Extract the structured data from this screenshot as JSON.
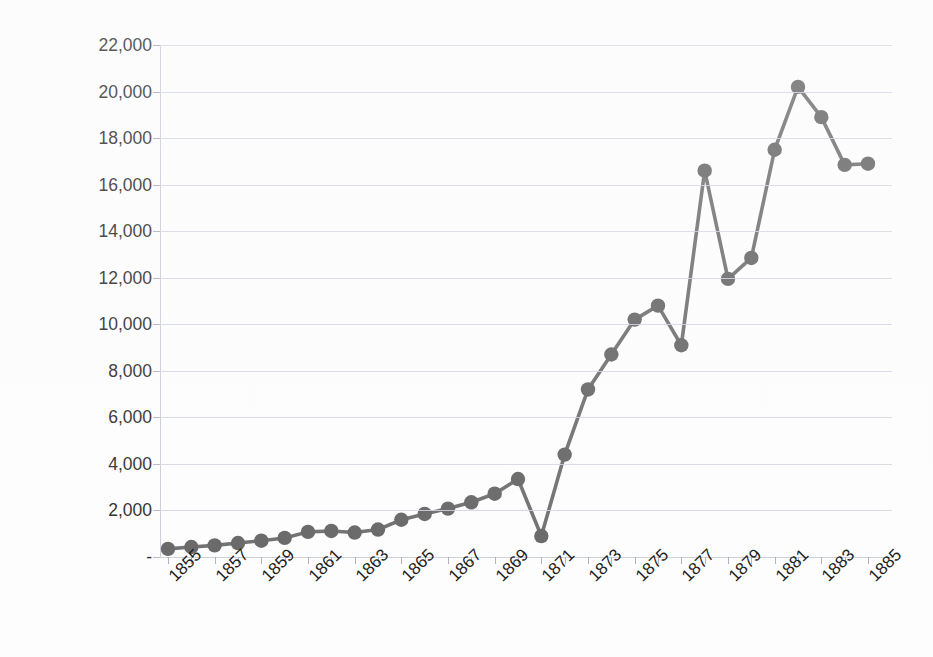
{
  "chart_data": {
    "type": "line",
    "title": "",
    "xlabel": "",
    "ylabel": "Quantity consumed (g)",
    "x": [
      1855,
      1856,
      1857,
      1858,
      1859,
      1860,
      1861,
      1862,
      1863,
      1864,
      1865,
      1866,
      1867,
      1868,
      1869,
      1870,
      1871,
      1872,
      1873,
      1874,
      1875,
      1876,
      1877,
      1878,
      1879,
      1880,
      1881,
      1882,
      1883,
      1884,
      1885
    ],
    "values": [
      350,
      430,
      500,
      600,
      700,
      820,
      1080,
      1120,
      1050,
      1180,
      1600,
      1850,
      2080,
      2350,
      2720,
      3350,
      900,
      4400,
      7200,
      8700,
      10200,
      10800,
      9100,
      16600,
      11950,
      12850,
      17500,
      20200,
      18900,
      16850,
      16900
    ],
    "series": [
      {
        "name": "Quantity consumed",
        "values": [
          350,
          430,
          500,
          600,
          700,
          820,
          1080,
          1120,
          1050,
          1180,
          1600,
          1850,
          2080,
          2350,
          2720,
          3350,
          900,
          4400,
          7200,
          8700,
          10200,
          10800,
          9100,
          16600,
          11950,
          12850,
          17500,
          20200,
          18900,
          16850,
          16900
        ]
      }
    ],
    "ylim": [
      0,
      22000
    ],
    "xlim": [
      1855,
      1885
    ],
    "y_ticks": [
      0,
      2000,
      4000,
      6000,
      8000,
      10000,
      12000,
      14000,
      16000,
      18000,
      20000,
      22000
    ],
    "y_tick_labels": [
      "-",
      "2,000",
      "4,000",
      "6,000",
      "8,000",
      "10,000",
      "12,000",
      "14,000",
      "16,000",
      "18,000",
      "20,000",
      "22,000"
    ],
    "x_tick_labels": [
      "1855",
      "1857",
      "1859",
      "1861",
      "1863",
      "1865",
      "1867",
      "1869",
      "1871",
      "1873",
      "1875",
      "1877",
      "1879",
      "1881",
      "1883",
      "1885"
    ],
    "x_tick_values": [
      1855,
      1857,
      1859,
      1861,
      1863,
      1865,
      1867,
      1869,
      1871,
      1873,
      1875,
      1877,
      1879,
      1881,
      1883,
      1885
    ],
    "grid": true,
    "legend": false,
    "legend_position": "none",
    "marker": "circle",
    "colors": {
      "series": "#6d6d6d",
      "marker": "#646464",
      "gridline": "#cfd4dc",
      "axis": "#b9bec6",
      "text": "#1d1d1d",
      "background": "#fdfdfd"
    }
  }
}
